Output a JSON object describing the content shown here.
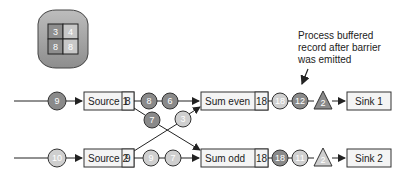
{
  "state_store": {
    "cells": [
      "3",
      "4",
      "8",
      "8"
    ]
  },
  "annotation": {
    "lines": [
      "Process buffered",
      "record after barrier",
      "was emitted"
    ]
  },
  "sources": [
    {
      "label": "Source 1",
      "offset": "8",
      "input_record": "9"
    },
    {
      "label": "Source 2",
      "offset": "9",
      "input_record": "10"
    }
  ],
  "top_stream": {
    "records": [
      "8",
      "6"
    ]
  },
  "cross_records": {
    "to_odd": "7",
    "to_even": "3"
  },
  "bottom_stream": {
    "records": [
      "9",
      "7"
    ]
  },
  "operators": [
    {
      "label": "Sum even",
      "state": "18",
      "outputs": [
        "18",
        "12"
      ],
      "barrier": "2"
    },
    {
      "label": "Sum odd",
      "state": "18",
      "outputs": [
        "18",
        "11"
      ],
      "barrier": "2"
    }
  ],
  "sinks": [
    {
      "label": "Sink 1"
    },
    {
      "label": "Sink 2"
    }
  ],
  "colors": {
    "dark": "#8a8a8a",
    "light": "#cfcfcf",
    "stroke": "#333333",
    "box": "#f4f4f4"
  }
}
